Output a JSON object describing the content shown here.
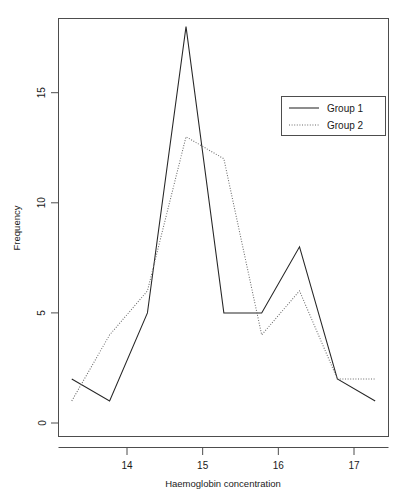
{
  "chart_data": {
    "type": "line",
    "title": "",
    "subtitle": "",
    "xlabel": "Haemoglobin concentration",
    "ylabel": "Frequency",
    "xlim": [
      13.1,
      17.45
    ],
    "ylim": [
      -0.6,
      18.8
    ],
    "xticks": [
      14,
      15,
      16,
      17
    ],
    "xticklabels": [
      "14",
      "15",
      "16",
      "17"
    ],
    "yticks": [
      0,
      5,
      10,
      15
    ],
    "yticklabels": [
      "0",
      "5",
      "10",
      "15"
    ],
    "grid": false,
    "legend_position": "top-right",
    "x": [
      13.27,
      13.77,
      14.27,
      14.78,
      15.28,
      15.78,
      16.28,
      16.78,
      17.28
    ],
    "series": [
      {
        "name": "Group 1",
        "style": "solid",
        "color": "#262626",
        "values": [
          2,
          1,
          5,
          18,
          5,
          5,
          8,
          2,
          1
        ]
      },
      {
        "name": "Group 2",
        "style": "dotted",
        "color": "#6b6b6b",
        "values": [
          1,
          4,
          6,
          13,
          12,
          4,
          6,
          2,
          2
        ]
      }
    ]
  },
  "axes": {
    "x_axis_label": "Haemoglobin concentration",
    "y_axis_label": "Frequency",
    "x_tick_labels": [
      "14",
      "15",
      "16",
      "17"
    ],
    "y_tick_labels": [
      "0",
      "5",
      "10",
      "15"
    ]
  },
  "legend": {
    "entries": [
      {
        "label": "Group 1",
        "style": "solid"
      },
      {
        "label": "Group 2",
        "style": "dotted"
      }
    ]
  }
}
